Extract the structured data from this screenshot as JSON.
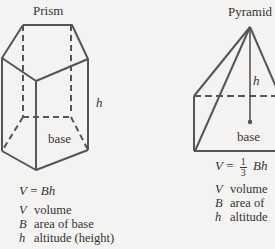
{
  "prism": {
    "title": "Prism",
    "height_label": "h",
    "base_label": "base",
    "formula": {
      "lhs": "V",
      "eq": "=",
      "rhs": "Bh"
    },
    "legend": [
      {
        "symbol": "V",
        "text": "volume"
      },
      {
        "symbol": "B",
        "text": "area of base"
      },
      {
        "symbol": "h",
        "text": "altitude (height)"
      }
    ]
  },
  "pyramid": {
    "title": "Pyramid",
    "height_label": "h",
    "base_label": "base",
    "formula": {
      "lhs": "V",
      "eq": "=",
      "frac_num": "1",
      "frac_den": "3",
      "rhs": "Bh"
    },
    "legend": [
      {
        "symbol": "V",
        "text": "volume"
      },
      {
        "symbol": "B",
        "text": "area of"
      },
      {
        "symbol": "h",
        "text": "altitude"
      }
    ]
  },
  "colors": {
    "line": "#555555",
    "background": "#f4f3f1",
    "text": "#333333"
  }
}
